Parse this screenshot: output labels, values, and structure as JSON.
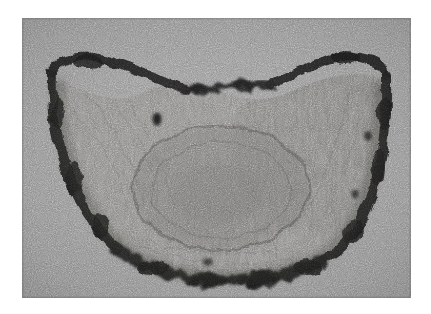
{
  "page": {
    "width": 431,
    "height": 314,
    "background_color": "#ffffff",
    "caption": "",
    "title": ""
  },
  "plate": {
    "x": 22,
    "y": 18,
    "width": 389,
    "height": 280,
    "kind": "micrograph",
    "modality": "transmission electron micrograph",
    "color_mode": "grayscale",
    "background_gray": "#8e8e8e",
    "noise": "heavy film grain",
    "alt_text": "Grainy grayscale micrograph of a crescent shaped sectioned specimen with a thick dark outer wall and granular interior"
  },
  "specimen": {
    "name": "sectioned-specimen",
    "shape": "crescent / bowl",
    "outer_wall": {
      "name": "dark-outer-wall",
      "color": "#1d1c1a",
      "description": "thick irregular dark band bounding the specimen",
      "thickness_px": "7 to 14"
    },
    "interior": {
      "name": "granular-interior",
      "color": "#7b7a78",
      "description": "lighter fibrous granular matrix filling the crescent"
    },
    "inner_body": {
      "name": "inner-oval-body",
      "color": "#6f6e6c",
      "description": "large faint oval structure centred within the interior",
      "center_x": 221,
      "center_y": 188,
      "radius_x": 88,
      "radius_y": 62
    },
    "inclusions": [
      {
        "name": "dark-inclusion-upper-left",
        "x": 157,
        "y": 119,
        "rx": 4.5,
        "ry": 6.5,
        "color": "#171615"
      },
      {
        "name": "dark-inclusion-right",
        "x": 368,
        "y": 136,
        "rx": 4,
        "ry": 5,
        "color": "#23221f"
      },
      {
        "name": "dark-inclusion-lower-right",
        "x": 355,
        "y": 194,
        "rx": 3.5,
        "ry": 4,
        "color": "#272523"
      },
      {
        "name": "dark-inclusion-bottom",
        "x": 208,
        "y": 262,
        "rx": 5,
        "ry": 4,
        "color": "#1c1b19"
      }
    ]
  },
  "colors": {
    "film_base": "#8e8e8e",
    "wall_dark": "#1d1c1a",
    "interior_mid": "#7b7a78",
    "page_white": "#ffffff",
    "grain_light": "#c9c9c9",
    "grain_dark": "#4a4a4a"
  },
  "annotations": {
    "labels": [],
    "scale_bar": null,
    "arrows": []
  }
}
